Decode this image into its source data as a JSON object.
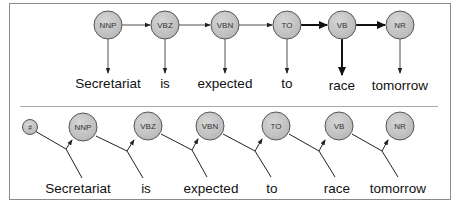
{
  "figure": {
    "frame_color": "#8a8a8a",
    "node_fill": "#c8c8c8",
    "node_stroke": "#555555",
    "edge_color": "#222222"
  },
  "hmm": {
    "title": "HMM (top panel)",
    "nodes": [
      {
        "tag": "NNP",
        "word": "Secretariat",
        "x": 108
      },
      {
        "tag": "VBZ",
        "word": "is",
        "x": 165
      },
      {
        "tag": "VBN",
        "word": "expected",
        "x": 225
      },
      {
        "tag": "TO",
        "word": "to",
        "x": 287
      },
      {
        "tag": "VB",
        "word": "race",
        "x": 342
      },
      {
        "tag": "NR",
        "word": "tomorrow",
        "x": 400
      }
    ],
    "bold_transitions": [
      "TO-VB",
      "VB-NR"
    ],
    "bold_emissions": [
      "VB-race"
    ]
  },
  "memm": {
    "title": "MEMM (bottom panel)",
    "start_node": "#",
    "nodes": [
      {
        "tag": "NNP",
        "word": "Secretariat",
        "x": 83
      },
      {
        "tag": "VBZ",
        "word": "is",
        "x": 148
      },
      {
        "tag": "VBN",
        "word": "expected",
        "x": 210
      },
      {
        "tag": "TO",
        "word": "to",
        "x": 276
      },
      {
        "tag": "VB",
        "word": "race",
        "x": 339
      },
      {
        "tag": "NR",
        "word": "tomorrow",
        "x": 400
      }
    ]
  },
  "labels": {
    "hmm_tags": [
      "NNP",
      "VBZ",
      "VBN",
      "TO",
      "VB",
      "NR"
    ],
    "hmm_words": [
      "Secretariat",
      "is",
      "expected",
      "to",
      "race",
      "tomorrow"
    ],
    "memm_start": "#",
    "memm_tags": [
      "NNP",
      "VBZ",
      "VBN",
      "TO",
      "VB",
      "NR"
    ],
    "memm_words": [
      "Secretariat",
      "is",
      "expected",
      "to",
      "race",
      "tomorrow"
    ]
  }
}
